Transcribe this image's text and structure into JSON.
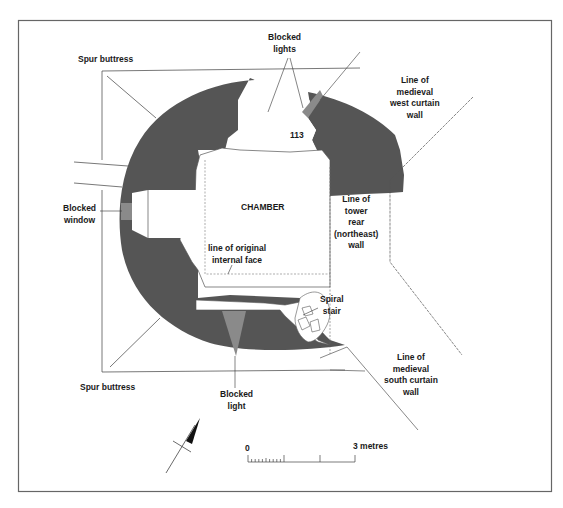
{
  "figure": {
    "colors": {
      "wall_fill": "#555555",
      "blocked_fill": "#8a8a8a",
      "line": "#444444",
      "frame": "#666666",
      "background": "#ffffff"
    },
    "labels": {
      "spur_buttress_top": "Spur buttress",
      "spur_buttress_bottom": "Spur buttress",
      "blocked_lights": "Blocked\nlights",
      "west_curtain": "Line of\nmedieval\nwest curtain\nwall",
      "room_number": "113",
      "chamber": "CHAMBER",
      "tower_rear": "Line of\ntower\nrear\n(northeast)\nwall",
      "blocked_window": "Blocked\nwindow",
      "original_face": "line of original\ninternal face",
      "spiral_stair": "Spiral\nstair",
      "south_curtain": "Line of\nmedieval\nsouth curtain\nwall",
      "blocked_light": "Blocked\nlight"
    },
    "scale_bar": {
      "start_label": "0",
      "end_label": "3 metres"
    },
    "north_arrow": {
      "icon": "north-arrow-icon"
    }
  }
}
